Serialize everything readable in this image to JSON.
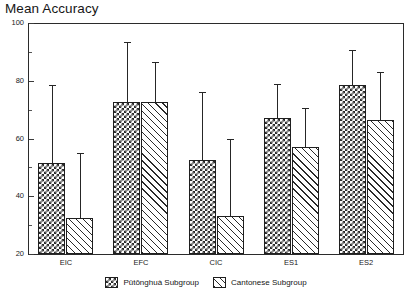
{
  "chart_data": {
    "type": "bar",
    "title": "Mean Accuracy",
    "xlabel": "",
    "ylabel": "",
    "ylim": [
      20,
      100
    ],
    "yticks": [
      20,
      40,
      60,
      80,
      100
    ],
    "ytick_labels": [
      "20",
      "40",
      "60",
      "80",
      "100"
    ],
    "minor_yticks": [
      30,
      50,
      70,
      90
    ],
    "grid": false,
    "legend_position": "bottom-center",
    "error_bars": "upper-only",
    "categories": [
      "EIC",
      "EFC",
      "CIC",
      "ES1",
      "ES2"
    ],
    "series": [
      {
        "name": "Pǔtōnghuà Subgroup",
        "pattern": "checker",
        "values": [
          51.5,
          72.5,
          52.5,
          67.0,
          78.5
        ],
        "error_upper": [
          78.5,
          93.5,
          76.0,
          79.0,
          90.5
        ]
      },
      {
        "name": "Cantonese Subgroup",
        "pattern": "hatch",
        "values": [
          32.5,
          72.5,
          33.0,
          57.0,
          66.5
        ],
        "error_upper": [
          55.0,
          86.5,
          60.0,
          70.5,
          83.0
        ]
      }
    ]
  },
  "legend": {
    "items": [
      {
        "label": "Pǔtōnghuà Subgroup",
        "pattern": "checker"
      },
      {
        "label": "Cantonese Subgroup",
        "pattern": "hatch"
      }
    ]
  }
}
